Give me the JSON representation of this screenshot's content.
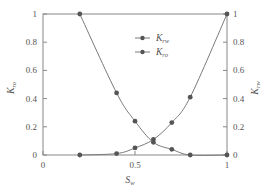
{
  "chart_data": {
    "type": "line",
    "title": "",
    "xlabel": "S_w",
    "ylabel_left": "K_ro",
    "ylabel_right": "K_rw",
    "xlim": [
      0,
      1
    ],
    "ylim_left": [
      0,
      1
    ],
    "ylim_right": [
      0,
      1
    ],
    "grid": false,
    "legend_position": "upper-center-right",
    "x_ticks": [
      "0",
      "0.5",
      "1"
    ],
    "x_tick_values": [
      0,
      0.5,
      1
    ],
    "y_left_ticks": [
      "0",
      "0.2",
      "0.4",
      "0.6",
      "0.8",
      "1"
    ],
    "y_right_ticks": [
      "0",
      "0.2",
      "0.4",
      "0.6",
      "0.8",
      "1"
    ],
    "y_tick_values": [
      0,
      0.2,
      0.4,
      0.6,
      0.8,
      1
    ],
    "series": [
      {
        "name": "K_rw",
        "axis": "right",
        "x": [
          0.2,
          0.4,
          0.5,
          0.6,
          0.7,
          0.8,
          1.0
        ],
        "values": [
          0.0,
          0.01,
          0.05,
          0.11,
          0.23,
          0.41,
          1.0
        ]
      },
      {
        "name": "K_ro",
        "axis": "left",
        "x": [
          0.2,
          0.4,
          0.5,
          0.6,
          0.7,
          0.8,
          1.0
        ],
        "values": [
          1.0,
          0.44,
          0.24,
          0.09,
          0.04,
          0.0,
          0.0
        ]
      }
    ]
  },
  "labels": {
    "x_axis": {
      "main": "S",
      "sub": "w"
    },
    "y_left": {
      "main": "K",
      "sub": "ro"
    },
    "y_right": {
      "main": "K",
      "sub": "rw"
    },
    "legend": [
      {
        "main": "K",
        "sub": "rw"
      },
      {
        "main": "K",
        "sub": "ro"
      }
    ]
  },
  "colors": {
    "line": "#7a7a7a",
    "marker": "#555555",
    "axis": "#888888",
    "text": "#555555"
  }
}
